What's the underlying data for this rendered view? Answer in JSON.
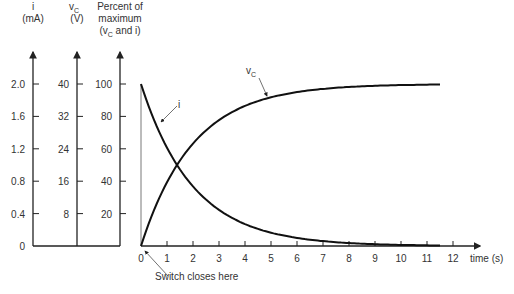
{
  "chart_data": {
    "type": "line",
    "title": "",
    "xlabel": "time (s)",
    "x_ticks": [
      0,
      1,
      2,
      3,
      4,
      5,
      6,
      7,
      8,
      9,
      10,
      11,
      12
    ],
    "xlim": [
      0,
      12.5
    ],
    "y_axes": [
      {
        "id": "i",
        "label_line1": "i",
        "label_line2": "(mA)",
        "ticks": [
          "0",
          "0.4",
          "0.8",
          "1.2",
          "1.6",
          "2.0"
        ]
      },
      {
        "id": "vc",
        "label_line1": "v",
        "label_sub": "C",
        "label_line2": "(V)",
        "ticks": [
          "",
          "8",
          "16",
          "24",
          "32",
          "40"
        ]
      },
      {
        "id": "pct",
        "label_line1": "Percent of",
        "label_line2": "maximum",
        "label_line3": "(v",
        "label_line3_sub": "C",
        "label_line3_end": " and i)",
        "ticks": [
          "",
          "20",
          "40",
          "60",
          "80",
          "100"
        ]
      }
    ],
    "ylim": [
      0,
      100
    ],
    "time_constant_s": 2,
    "series": [
      {
        "name": "vC",
        "label": "v",
        "label_sub": "C",
        "x": [
          0,
          0.5,
          1,
          1.5,
          2,
          3,
          4,
          5,
          6,
          7,
          8,
          9,
          10,
          11,
          11.5
        ],
        "values": [
          0,
          22,
          39,
          53,
          63,
          78,
          86,
          92,
          95,
          97,
          98,
          99,
          99,
          100,
          100
        ]
      },
      {
        "name": "i",
        "label": "i",
        "x": [
          0,
          0.5,
          1,
          1.5,
          2,
          3,
          4,
          5,
          6,
          7,
          8,
          9,
          10,
          11,
          11.5
        ],
        "values": [
          100,
          78,
          61,
          47,
          37,
          22,
          14,
          8,
          5,
          3,
          2,
          1,
          1,
          0,
          0
        ]
      }
    ],
    "annotations": [
      {
        "text": "Switch closes here",
        "x": 0,
        "y": 0
      }
    ],
    "grid": false,
    "legend": "inline labels"
  }
}
